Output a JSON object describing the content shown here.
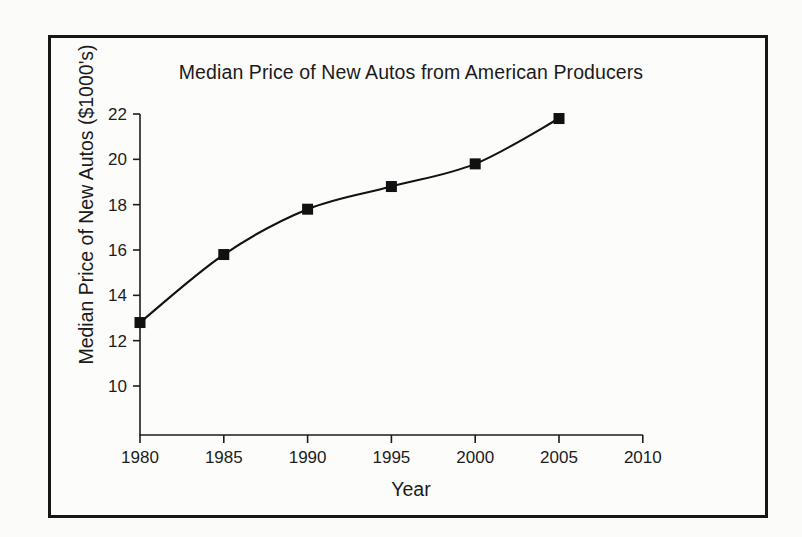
{
  "chart_data": {
    "type": "line",
    "title": "Median Price of New Autos from American Producers",
    "xlabel": "Year",
    "ylabel": "Median Price of New Autos ($1000's)",
    "x": [
      1980,
      1985,
      1990,
      1995,
      2000,
      2005
    ],
    "values": [
      12.8,
      15.8,
      17.8,
      18.8,
      19.8,
      21.8
    ],
    "xticks": [
      1980,
      1985,
      1990,
      1995,
      2000,
      2005,
      2010
    ],
    "xtick_labels": [
      "1980",
      "1985",
      "1990",
      "1995",
      "2000",
      "2005",
      "2010"
    ],
    "yticks": [
      10,
      12,
      14,
      16,
      18,
      20,
      22
    ],
    "ytick_labels": [
      "10",
      "12",
      "14",
      "16",
      "18",
      "20",
      "22"
    ],
    "xlim": [
      1980,
      2010
    ],
    "ylim": [
      8.8,
      22
    ],
    "grid": false,
    "legend": false,
    "marker": "square",
    "series_color": "#111111",
    "background_color": "#fcfcfb",
    "frame_color": "#161616"
  }
}
